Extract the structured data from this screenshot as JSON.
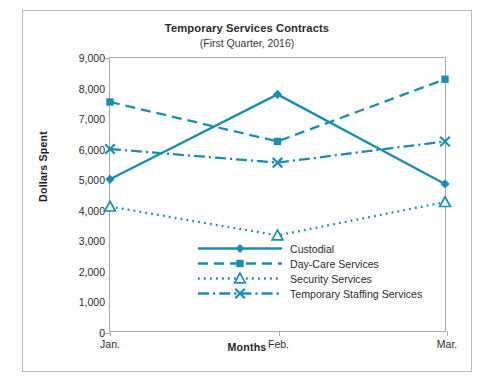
{
  "chart_data": {
    "type": "line",
    "title": "Temporary Services Contracts",
    "subtitle": "(First Quarter, 2016)",
    "xlabel": "Months",
    "ylabel": "Dollars Spent",
    "categories": [
      "Jan.",
      "Feb.",
      "Mar."
    ],
    "ylim": [
      0,
      9000
    ],
    "ytick_labels": [
      "0",
      "1,000",
      "2,000",
      "3,000",
      "4,000",
      "5,000",
      "6,000",
      "7,000",
      "8,000",
      "9,000"
    ],
    "ytick_values": [
      0,
      1000,
      2000,
      3000,
      4000,
      5000,
      6000,
      7000,
      8000,
      9000
    ],
    "grid": false,
    "legend_position": "inside-bottom-center",
    "accent_color": "#1b8db5",
    "frame_color": "#a7abae",
    "series": [
      {
        "name": "Custodial",
        "values": [
          5000,
          7800,
          4850
        ],
        "line_style": "solid",
        "marker": "diamond",
        "color": "#1b8db5"
      },
      {
        "name": "Day-Care Services",
        "values": [
          7550,
          6250,
          8300
        ],
        "line_style": "dashed",
        "marker": "square",
        "color": "#1b8db5"
      },
      {
        "name": "Security Services",
        "values": [
          4100,
          3150,
          4250
        ],
        "line_style": "dotted",
        "marker": "triangle-open",
        "color": "#1b8db5"
      },
      {
        "name": "Temporary Staffing Services",
        "values": [
          6000,
          5550,
          6250
        ],
        "line_style": "dash-dot",
        "marker": "x",
        "color": "#1b8db5"
      }
    ]
  }
}
